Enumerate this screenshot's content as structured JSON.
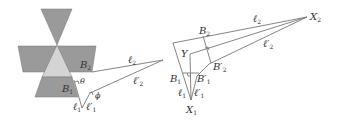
{
  "figure": {
    "left_panel": {
      "labels": {
        "B2": {
          "main": "B",
          "sub": "2"
        },
        "B1": {
          "main": "B",
          "sub": "1"
        },
        "theta": "θ",
        "phi": "ϕ",
        "l2": {
          "main": "ℓ",
          "sub": "2"
        },
        "l2p": {
          "main": "ℓ′",
          "sub": "2"
        },
        "l1": {
          "main": "ℓ",
          "sub": "1"
        },
        "l1p": {
          "main": "ℓ′",
          "sub": "1"
        }
      },
      "colors": {
        "dark_fill": "#9a9a9a",
        "light_fill": "#d4d4d4",
        "line": "#777777"
      }
    },
    "right_panel": {
      "labels": {
        "X2": {
          "main": "X",
          "sub": "2"
        },
        "X1": {
          "main": "X",
          "sub": "1"
        },
        "Y": "Y",
        "B2": {
          "main": "B",
          "sub": "2"
        },
        "B2p": {
          "main": "B′",
          "sub": "2"
        },
        "B1": {
          "main": "B",
          "sub": "1"
        },
        "B1p": {
          "main": "B′",
          "sub": "1"
        },
        "l2": {
          "main": "ℓ",
          "sub": "2"
        },
        "l2p": {
          "main": "ℓ′",
          "sub": "2"
        },
        "l1": {
          "main": "ℓ",
          "sub": "1"
        },
        "l1p": {
          "main": "ℓ′",
          "sub": "1"
        }
      }
    }
  }
}
